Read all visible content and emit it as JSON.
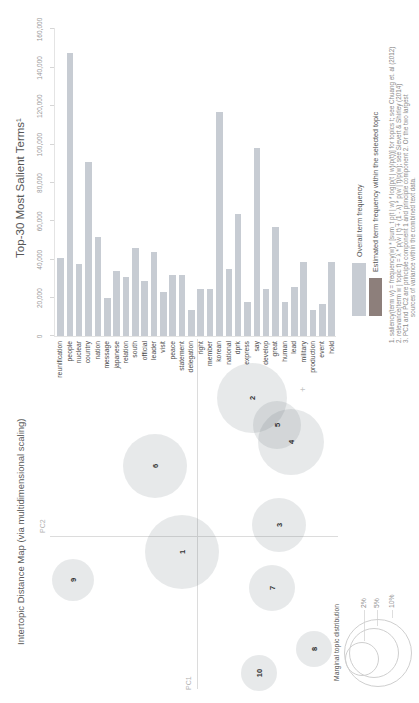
{
  "page": {
    "background": "#ffffff"
  },
  "map": {
    "title": "Intertopic Distance Map (via multidimensional scaling)",
    "axis": {
      "x_label": "PC1",
      "y_label": "PC2"
    },
    "marginal_legend": {
      "title": "Marginal topic distribution",
      "sizes": [
        {
          "label": "2%"
        },
        {
          "label": "5%"
        },
        {
          "label": "10%"
        }
      ]
    }
  },
  "bars": {
    "title": "Top-30 Most Salient Terms¹",
    "axis_tick_labels": [
      "0",
      "20,000",
      "40,000",
      "60,000",
      "80,000",
      "100,000",
      "120,000",
      "140,000",
      "160,000"
    ],
    "legend": [
      {
        "label": "Overall term frequency",
        "color": "#c7ccd3"
      },
      {
        "label": "Estimated term frequency within the selected topic",
        "color": "#8d7f7b"
      }
    ],
    "footnotes": [
      "1. saliency(term w) = frequency(w) * [sum_t p(t | w) * log(p(t | w)/p(t))] for topics t; see Chuang et. al (2012)",
      "2. relevance(term w | topic t) = λ * p(w | t) + (1 - λ) * p(w | t)/p(w); see Sievert & Shirley (2014)",
      "3. PC1 and PC2 are principle component 1 and principle component 2. Or the two largest",
      "sources of variance within the combined text data."
    ]
  },
  "chart_data": [
    {
      "type": "bar",
      "title": "Top-30 Most Salient Terms¹",
      "orientation": "horizontal",
      "xlabel": "Overall term frequency",
      "xlim": [
        0,
        160000
      ],
      "bar_color": "#c7ccd3",
      "categories": [
        "reunification",
        "people",
        "nuclear",
        "country",
        "nation",
        "message",
        "japanese",
        "relation",
        "south",
        "official",
        "leader",
        "visit",
        "peace",
        "statement",
        "delegation",
        "right",
        "member",
        "korean",
        "national",
        "dprk",
        "express",
        "say",
        "develop",
        "great",
        "human",
        "lead",
        "military",
        "production",
        "event",
        "hold"
      ],
      "values": [
        41000,
        148000,
        38000,
        91000,
        52000,
        20000,
        34000,
        31000,
        46000,
        29000,
        44000,
        23000,
        32000,
        32000,
        14000,
        25000,
        25000,
        117000,
        35000,
        64000,
        18000,
        98000,
        25000,
        57000,
        18000,
        26000,
        39000,
        14000,
        17000,
        39000
      ]
    },
    {
      "type": "scatter",
      "title": "Intertopic Distance Map (via multidimensional scaling)",
      "xlabel": "PC1",
      "ylabel": "PC2",
      "note": "topic circles; x/y/r are pixel coordinates on the 703x419 unrotated panel",
      "points": [
        {
          "topic": "1",
          "x": 151,
          "y": 182,
          "r": 37
        },
        {
          "topic": "2",
          "x": 305,
          "y": 252,
          "r": 35
        },
        {
          "topic": "3",
          "x": 178,
          "y": 279,
          "r": 27
        },
        {
          "topic": "4",
          "x": 261,
          "y": 291,
          "r": 33
        },
        {
          "topic": "5",
          "x": 278,
          "y": 277,
          "r": 24
        },
        {
          "topic": "6",
          "x": 237,
          "y": 155,
          "r": 32
        },
        {
          "topic": "7",
          "x": 115,
          "y": 272,
          "r": 23
        },
        {
          "topic": "8",
          "x": 54,
          "y": 314,
          "r": 18
        },
        {
          "topic": "9",
          "x": 123,
          "y": 73,
          "r": 21
        },
        {
          "topic": "10",
          "x": 30,
          "y": 259,
          "r": 18
        }
      ]
    }
  ]
}
